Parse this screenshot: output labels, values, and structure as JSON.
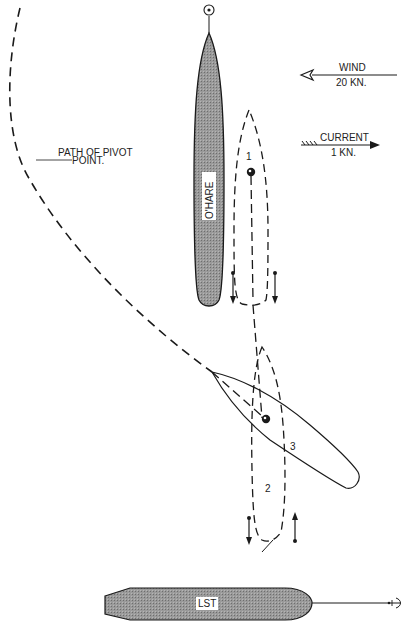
{
  "labels": {
    "path_of_pivot_line1": "PATH OF PIVOT",
    "path_of_pivot_line2": "POINT.",
    "wind_title": "WIND",
    "wind_speed": "20 KN.",
    "current_title": "CURRENT",
    "current_speed": "1 KN.",
    "ohare": "O'HARE",
    "lst": "LST",
    "position_1": "1",
    "position_2": "2",
    "position_3": "3"
  },
  "colors": {
    "ink": "#1a1a1a",
    "hull_fill": "#8c8c8c",
    "label_bg": "#ffffff"
  },
  "icons": {
    "wind_arrow": "open-arrowhead-left",
    "current_arrow": "filled-arrowhead-right",
    "pivot_point": "circle-dot",
    "anchor": "anchor-hook"
  }
}
